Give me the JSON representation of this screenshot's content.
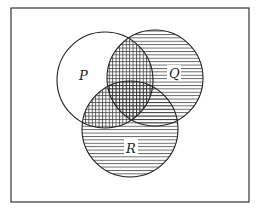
{
  "diagram": {
    "type": "venn",
    "sets": [
      {
        "id": "P",
        "label": "P"
      },
      {
        "id": "Q",
        "label": "Q"
      },
      {
        "id": "R",
        "label": "R"
      }
    ],
    "shading": {
      "horizontal_lines": "Q ∪ R",
      "vertical_lines": "P ∩ (Q ∪ R)",
      "unshaded": "P only"
    },
    "colors": {
      "ink": "#222222",
      "background": "#ffffff"
    }
  }
}
